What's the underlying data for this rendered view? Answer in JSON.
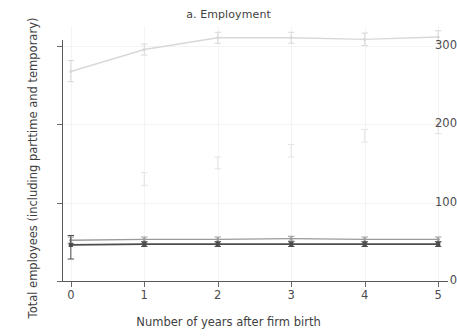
{
  "chart_data": {
    "type": "line",
    "title": "a. Employment",
    "xlabel": "Number of years after firm birth",
    "ylabel": "Total employees (including parttime and temporary)",
    "x": [
      0,
      1,
      2,
      3,
      4,
      5
    ],
    "xlim": [
      -0.12,
      5.12
    ],
    "ylim": [
      0,
      325
    ],
    "xticks": [
      0,
      1,
      2,
      3,
      4,
      5
    ],
    "xticklabels": [
      "0",
      "1",
      "2",
      "3",
      "4",
      "5"
    ],
    "yticks": [
      0,
      100,
      200,
      300
    ],
    "yticklabels": [
      "0",
      "100",
      "200",
      "300"
    ],
    "grid": true,
    "legend": "none",
    "series": [
      {
        "name": "high-growth-firms",
        "color": "#d8d8d8",
        "marker": "point",
        "values": [
          267,
          295,
          310,
          310,
          308,
          311
        ],
        "err_low": [
          254,
          288,
          303,
          303,
          300,
          303
        ],
        "err_high": [
          281,
          302,
          317,
          317,
          316,
          319
        ]
      },
      {
        "name": "sparse-upper-estimates",
        "color": "#e3e3e3",
        "marker": "errorbar-only",
        "values": [
          null,
          130,
          150,
          166,
          185,
          196
        ],
        "err_low": [
          null,
          122,
          143,
          158,
          177,
          188
        ],
        "err_high": [
          null,
          138,
          158,
          174,
          193,
          204
        ]
      },
      {
        "name": "average-firms-upper",
        "color": "#9a9a9a",
        "marker": "point",
        "values": [
          52,
          53,
          53,
          54,
          53,
          53
        ],
        "err_low": [
          48,
          50,
          50,
          51,
          50,
          50
        ],
        "err_high": [
          56,
          56,
          56,
          57,
          56,
          56
        ]
      },
      {
        "name": "average-firms-lower",
        "color": "#4d4d4f",
        "marker": "square",
        "values": [
          46,
          47,
          47,
          47,
          47,
          47
        ],
        "err_low": [
          28,
          44,
          44,
          44,
          44,
          44
        ],
        "err_high": [
          58,
          50,
          50,
          50,
          50,
          50
        ]
      }
    ]
  },
  "title": {
    "text": "a. Employment"
  },
  "axes": {
    "y_label": "Total employees (including parttime and temporary)",
    "x_label": "Number of years after firm birth"
  }
}
